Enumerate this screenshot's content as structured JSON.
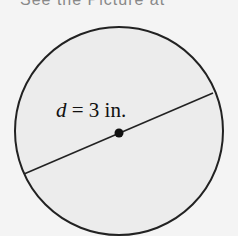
{
  "header": {
    "cut_text": "See the Picture at"
  },
  "diagram": {
    "shape": "circle",
    "fill": "#ececec",
    "stroke": "#222222",
    "label_var": "d",
    "label_rest": " = 3 in.",
    "diameter_value": "3",
    "diameter_unit": "in.",
    "center_point": "center-dot"
  }
}
